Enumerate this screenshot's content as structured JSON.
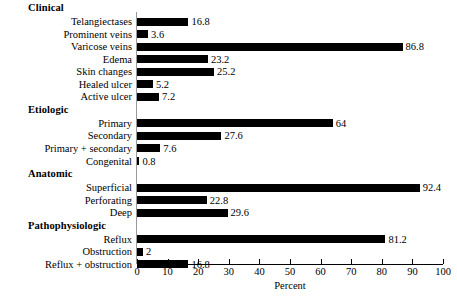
{
  "chart_data": {
    "type": "bar",
    "orientation": "horizontal",
    "title": "",
    "xlabel": "Percent",
    "ylabel": "",
    "xlim": [
      0,
      100
    ],
    "xticks": [
      0,
      10,
      20,
      30,
      40,
      50,
      60,
      70,
      80,
      90,
      100
    ],
    "grid": false,
    "legend": null,
    "bar_color": "#000000",
    "background_color": "#ffffff",
    "groups": [
      {
        "name": "Clinical",
        "categories": [
          "Telangiectases",
          "Prominent veins",
          "Varicose veins",
          "Edema",
          "Skin changes",
          "Healed ulcer",
          "Active ulcer"
        ],
        "values": [
          16.8,
          3.6,
          86.8,
          23.2,
          25.2,
          5.2,
          7.2
        ],
        "value_labels": [
          "16.8",
          "3.6",
          "86.8",
          "23.2",
          "25.2",
          "5.2",
          "7.2"
        ]
      },
      {
        "name": "Etiologic",
        "categories": [
          "Primary",
          "Secondary",
          "Primary + secondary",
          "Congenital"
        ],
        "values": [
          64,
          27.6,
          7.6,
          0.8
        ],
        "value_labels": [
          "64",
          "27.6",
          "7.6",
          "0.8"
        ]
      },
      {
        "name": "Anatomic",
        "categories": [
          "Superficial",
          "Perforating",
          "Deep"
        ],
        "values": [
          92.4,
          22.8,
          29.6
        ],
        "value_labels": [
          "92.4",
          "22.8",
          "29.6"
        ]
      },
      {
        "name": "Pathophysiologic",
        "categories": [
          "Reflux",
          "Obstruction",
          "Reflux + obstruction"
        ],
        "values": [
          81.2,
          2,
          16.8
        ],
        "value_labels": [
          "81.2",
          "2",
          "16.8"
        ]
      }
    ]
  }
}
